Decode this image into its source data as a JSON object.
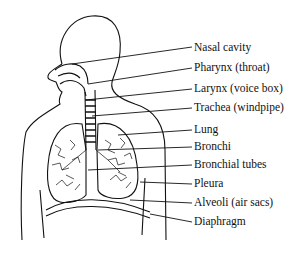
{
  "diagram": {
    "type": "anatomical-labeled-illustration",
    "labels": [
      {
        "text": "Nasal cavity",
        "y": 41
      },
      {
        "text": "Pharynx (throat)",
        "y": 61
      },
      {
        "text": "Larynx (voice box)",
        "y": 82
      },
      {
        "text": "Trachea (windpipe)",
        "y": 101
      },
      {
        "text": "Lung",
        "y": 123
      },
      {
        "text": "Bronchi",
        "y": 140
      },
      {
        "text": "Bronchial tubes",
        "y": 158
      },
      {
        "text": "Pleura",
        "y": 177
      },
      {
        "text": "Alveoli (air sacs)",
        "y": 196
      },
      {
        "text": "Diaphragm",
        "y": 215
      }
    ]
  }
}
